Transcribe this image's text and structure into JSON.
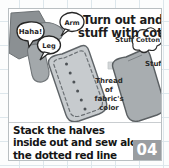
{
  "card": {
    "title": {
      "line1": "Turn out and",
      "line2": "stuff with cotton"
    },
    "caption": {
      "line1": "Stack the halves",
      "line2": "inside out and sew along",
      "line3": "the dotted red line"
    },
    "step_badge": "04"
  },
  "illustration": {
    "speech_bubbles": [
      {
        "name": "haha-bubble",
        "text": "Haha!"
      },
      {
        "name": "arm-bubble",
        "text": "Arm"
      },
      {
        "name": "leg-bubble",
        "text": "Leg"
      }
    ],
    "labels": {
      "thread_line1": "Thread",
      "thread_line2": "of",
      "thread_line3": "fabric's",
      "thread_line4": "color",
      "stuff_top": "Stuff",
      "stuff_right": "Stuff",
      "cotton": "Cotton"
    },
    "arrow": "right-arrow",
    "left_piece": "sewn-fabric-halves-dotted-red-line",
    "right_piece": "turned-out-stuffed-piece"
  },
  "colors": {
    "grid": "#dde7ec",
    "card_bg": "#ffffff",
    "card_border": "#b9bfc2",
    "fabric_light": "#c9cdd0",
    "fabric_dark": "#8f9497",
    "limb_gray": "#9da2a5",
    "badge_bg": "#9a9ea1",
    "text": "#1c1c1c",
    "stitch": "#55595c"
  }
}
